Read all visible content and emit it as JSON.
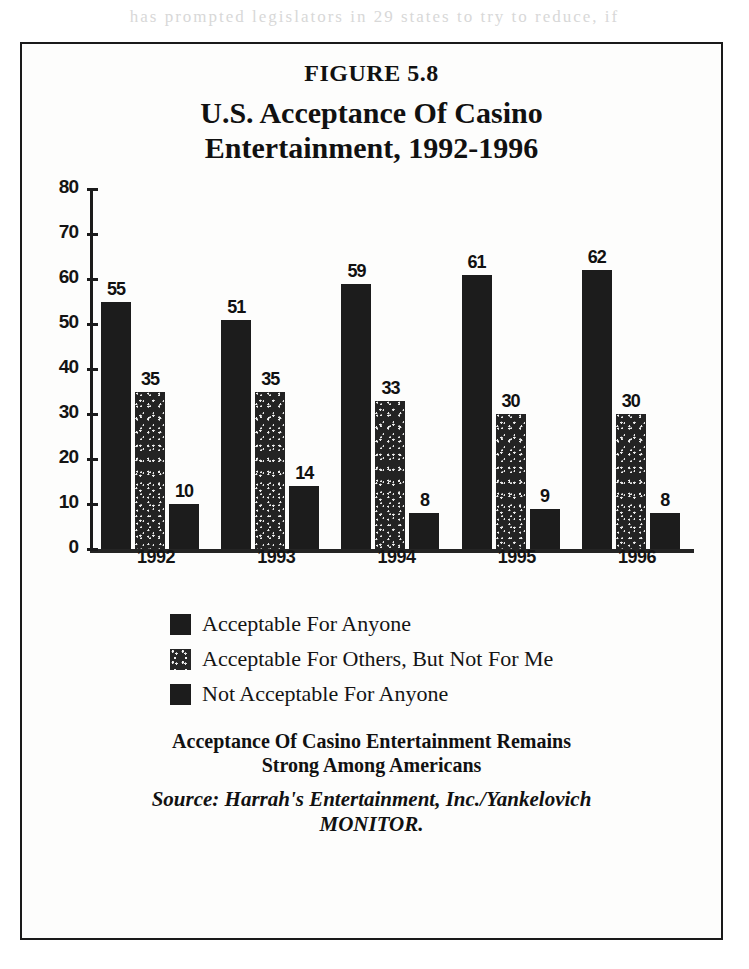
{
  "page": {
    "bleed_text": "has prompted legislators in 29 states to try to reduce, if"
  },
  "figure": {
    "label": "FIGURE 5.8",
    "title_line1": "U.S. Acceptance Of Casino",
    "title_line2": "Entertainment, 1992-1996",
    "caption_line1": "Acceptance Of Casino Entertainment Remains",
    "caption_line2": "Strong Among Americans",
    "source_line1": "Source: Harrah's Entertainment, Inc./Yankelovich",
    "source_line2": "MONITOR."
  },
  "chart_data": {
    "type": "bar",
    "title": "U.S. Acceptance Of Casino Entertainment, 1992-1996",
    "xlabel": "",
    "ylabel": "",
    "ylim": [
      0,
      80
    ],
    "yticks": [
      0,
      10,
      20,
      30,
      40,
      50,
      60,
      70,
      80
    ],
    "grid": false,
    "legend_position": "below",
    "categories": [
      "1992",
      "1993",
      "1994",
      "1995",
      "1996"
    ],
    "series": [
      {
        "name": "Acceptable For Anyone",
        "fill": "solid",
        "color": "#1c1c1c",
        "values": [
          55,
          51,
          59,
          61,
          62
        ]
      },
      {
        "name": "Acceptable For Others, But Not For Me",
        "fill": "textured",
        "color": "#262626",
        "values": [
          35,
          35,
          33,
          30,
          30
        ]
      },
      {
        "name": "Not Acceptable For Anyone",
        "fill": "solid",
        "color": "#1c1c1c",
        "values": [
          10,
          14,
          8,
          9,
          8
        ]
      }
    ]
  }
}
